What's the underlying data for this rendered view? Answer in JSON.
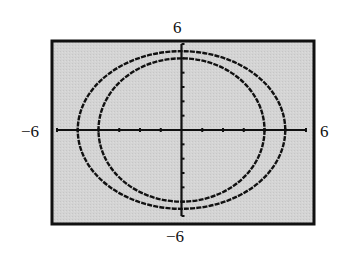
{
  "window": {
    "xmin_label": "−6",
    "xmax_label": "6",
    "ymin_label": "−6",
    "ymax_label": "6"
  },
  "colors": {
    "background": "#ffffff",
    "screen_fill": "#d2d2d2",
    "frame": "#111111",
    "axes": "#111111",
    "curves": "#111111"
  },
  "chart_data": {
    "type": "line",
    "title": "",
    "xlabel": "",
    "ylabel": "",
    "xlim": [
      -6,
      6
    ],
    "ylim": [
      -6,
      6
    ],
    "xscl": 1,
    "yscl": 1,
    "grid": false,
    "tick_labels": {
      "x": [
        "−6",
        "6"
      ],
      "y": [
        "−6",
        "6"
      ]
    },
    "series": [
      {
        "name": "outer ellipse",
        "shape": "ellipse",
        "center": [
          0,
          0
        ],
        "semi_axis_x": 5,
        "semi_axis_y": 5.5
      },
      {
        "name": "inner ellipse",
        "shape": "ellipse",
        "center": [
          0,
          0
        ],
        "semi_axis_x": 4,
        "semi_axis_y": 5
      }
    ],
    "legend": null
  }
}
